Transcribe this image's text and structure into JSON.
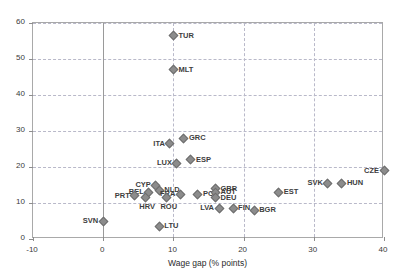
{
  "chart_data": {
    "type": "scatter",
    "title": "",
    "xlabel": "Wage gap (% points)",
    "ylabel": "Gender gap (% points)",
    "xlim": [
      -10,
      40
    ],
    "ylim": [
      0,
      60
    ],
    "xticks": [
      "-10",
      "0",
      "10",
      "20",
      "30",
      "40"
    ],
    "yticks": [
      "0",
      "10",
      "20",
      "30",
      "40",
      "50",
      "60"
    ],
    "grid": "dashed both axes",
    "legend": "none",
    "marker_color": "#8c8c8c",
    "points": [
      {
        "label": "TUR",
        "x": 10.0,
        "y": 56.5,
        "pos": "right"
      },
      {
        "label": "MLT",
        "x": 10.0,
        "y": 47.0,
        "pos": "right"
      },
      {
        "label": "GRC",
        "x": 11.5,
        "y": 28.0,
        "pos": "right"
      },
      {
        "label": "ITA",
        "x": 9.5,
        "y": 26.5,
        "pos": "left"
      },
      {
        "label": "ESP",
        "x": 12.5,
        "y": 22.0,
        "pos": "right"
      },
      {
        "label": "LUX",
        "x": 10.5,
        "y": 21.0,
        "pos": "left"
      },
      {
        "label": "CYP",
        "x": 7.5,
        "y": 15.0,
        "pos": "left"
      },
      {
        "label": "NLD",
        "x": 8.0,
        "y": 13.5,
        "pos": "right"
      },
      {
        "label": "BEL",
        "x": 6.5,
        "y": 13.0,
        "pos": "left"
      },
      {
        "label": "FRA",
        "x": 11.0,
        "y": 12.5,
        "pos": "left"
      },
      {
        "label": "POL",
        "x": 13.5,
        "y": 12.5,
        "pos": "right"
      },
      {
        "label": "PRT",
        "x": 4.5,
        "y": 12.0,
        "pos": "left"
      },
      {
        "label": "HRV",
        "x": 6.0,
        "y": 11.5,
        "pos": "below"
      },
      {
        "label": "ROU",
        "x": 9.0,
        "y": 11.5,
        "pos": "below"
      },
      {
        "label": "GBR",
        "x": 16.0,
        "y": 14.0,
        "pos": "right"
      },
      {
        "label": "AUT",
        "x": 16.0,
        "y": 13.0,
        "pos": "right"
      },
      {
        "label": "DEU",
        "x": 16.0,
        "y": 11.5,
        "pos": "right"
      },
      {
        "label": "SVK",
        "x": 32.0,
        "y": 15.5,
        "pos": "left"
      },
      {
        "label": "HUN",
        "x": 34.0,
        "y": 15.5,
        "pos": "right"
      },
      {
        "label": "CZE",
        "x": 40.0,
        "y": 19.0,
        "pos": "left"
      },
      {
        "label": "EST",
        "x": 25.0,
        "y": 13.0,
        "pos": "right"
      },
      {
        "label": "LVA",
        "x": 16.5,
        "y": 8.5,
        "pos": "left"
      },
      {
        "label": "FIN",
        "x": 18.5,
        "y": 8.5,
        "pos": "right"
      },
      {
        "label": "BGR",
        "x": 21.5,
        "y": 8.0,
        "pos": "right"
      },
      {
        "label": "SVN",
        "x": 0.0,
        "y": 5.0,
        "pos": "left"
      },
      {
        "label": "LTU",
        "x": 8.0,
        "y": 3.5,
        "pos": "right"
      }
    ]
  }
}
